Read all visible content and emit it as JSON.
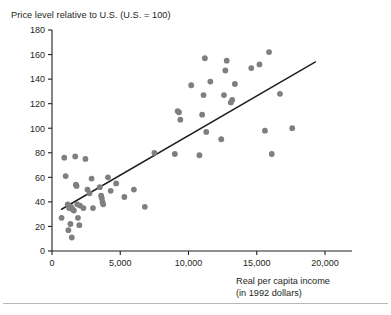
{
  "figure": {
    "title": "Price level relative to U.S. (U.S. = 100)",
    "xlabel_line1": "Real per capita income",
    "xlabel_line2": "(in 1992 dollars)",
    "point_color": "#7f7f7f",
    "line_color": "#231f20",
    "axis_color": "#231f20"
  },
  "chart_data": {
    "type": "scatter",
    "title": "Price level relative to U.S. (U.S. = 100)",
    "xlabel": "Real per capita income (in 1992 dollars)",
    "ylabel": "Price level relative to U.S. (U.S. = 100)",
    "xlim": [
      0,
      21000
    ],
    "ylim": [
      0,
      180
    ],
    "xticks": [
      0,
      5000,
      10000,
      15000,
      20000
    ],
    "xticklabels": [
      "0",
      "5,000",
      "10,000",
      "15,000",
      "20,000"
    ],
    "yticks": [
      0,
      20,
      40,
      60,
      80,
      100,
      120,
      140,
      160,
      180
    ],
    "yticklabels": [
      "0",
      "20",
      "40",
      "60",
      "80",
      "100",
      "120",
      "140",
      "160",
      "180"
    ],
    "grid": false,
    "legend": false,
    "marker": "circle",
    "marker_size": 3.6,
    "points": [
      {
        "x": 700,
        "y": 27
      },
      {
        "x": 900,
        "y": 76
      },
      {
        "x": 1000,
        "y": 61
      },
      {
        "x": 1150,
        "y": 38
      },
      {
        "x": 1200,
        "y": 17
      },
      {
        "x": 1250,
        "y": 35
      },
      {
        "x": 1350,
        "y": 22
      },
      {
        "x": 1400,
        "y": 36
      },
      {
        "x": 1450,
        "y": 11
      },
      {
        "x": 1500,
        "y": 34
      },
      {
        "x": 1600,
        "y": 33
      },
      {
        "x": 1700,
        "y": 77
      },
      {
        "x": 1750,
        "y": 54
      },
      {
        "x": 1800,
        "y": 53
      },
      {
        "x": 1850,
        "y": 38
      },
      {
        "x": 1900,
        "y": 27
      },
      {
        "x": 2000,
        "y": 21
      },
      {
        "x": 2050,
        "y": 37
      },
      {
        "x": 2300,
        "y": 35
      },
      {
        "x": 2450,
        "y": 75
      },
      {
        "x": 2600,
        "y": 50
      },
      {
        "x": 2750,
        "y": 47
      },
      {
        "x": 2900,
        "y": 59
      },
      {
        "x": 3000,
        "y": 35
      },
      {
        "x": 3500,
        "y": 52
      },
      {
        "x": 3600,
        "y": 45
      },
      {
        "x": 3650,
        "y": 43
      },
      {
        "x": 3700,
        "y": 40
      },
      {
        "x": 3750,
        "y": 38
      },
      {
        "x": 4100,
        "y": 60
      },
      {
        "x": 4300,
        "y": 49
      },
      {
        "x": 4700,
        "y": 55
      },
      {
        "x": 5300,
        "y": 44
      },
      {
        "x": 6000,
        "y": 50
      },
      {
        "x": 6800,
        "y": 36
      },
      {
        "x": 7500,
        "y": 80
      },
      {
        "x": 9200,
        "y": 114
      },
      {
        "x": 9300,
        "y": 113
      },
      {
        "x": 9400,
        "y": 107
      },
      {
        "x": 9000,
        "y": 79
      },
      {
        "x": 10200,
        "y": 135
      },
      {
        "x": 10800,
        "y": 78
      },
      {
        "x": 11000,
        "y": 111
      },
      {
        "x": 11100,
        "y": 127
      },
      {
        "x": 11200,
        "y": 157
      },
      {
        "x": 11300,
        "y": 97
      },
      {
        "x": 11600,
        "y": 138
      },
      {
        "x": 12400,
        "y": 91
      },
      {
        "x": 12600,
        "y": 127
      },
      {
        "x": 12700,
        "y": 147
      },
      {
        "x": 12800,
        "y": 155
      },
      {
        "x": 13100,
        "y": 121
      },
      {
        "x": 13200,
        "y": 123
      },
      {
        "x": 13400,
        "y": 136
      },
      {
        "x": 14600,
        "y": 149
      },
      {
        "x": 15200,
        "y": 152
      },
      {
        "x": 15600,
        "y": 98
      },
      {
        "x": 15900,
        "y": 162
      },
      {
        "x": 16100,
        "y": 79
      },
      {
        "x": 16700,
        "y": 128
      },
      {
        "x": 17600,
        "y": 100
      }
    ],
    "trendline": {
      "x_start": 700,
      "y_start": 34,
      "x_end": 19300,
      "y_end": 154
    }
  }
}
